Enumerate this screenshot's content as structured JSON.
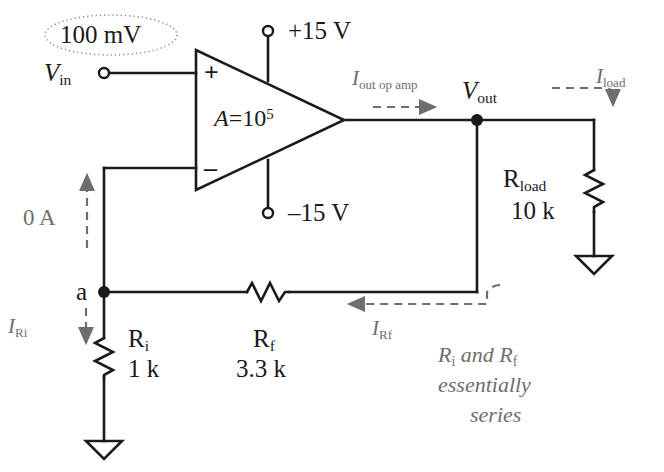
{
  "figure": {
    "type": "circuit-schematic",
    "colors": {
      "wire": "#1a1a1a",
      "annotation": "#6e6e6e",
      "background": "#ffffff"
    }
  },
  "source": {
    "callout_value": "100 mV",
    "input_terminal_label": "V",
    "input_terminal_sub": "in"
  },
  "opamp": {
    "gain_label": "A",
    "gain_equals": "=10",
    "gain_exponent": "5",
    "plus_label": "+",
    "minus_label": "–",
    "supply_pos": "+15 V",
    "supply_neg": "–15 V"
  },
  "output": {
    "node_label": "V",
    "node_sub": "out",
    "current_label": "I",
    "current_sub": "out op amp"
  },
  "load": {
    "name": "R",
    "name_sub": "load",
    "value": "10 k",
    "current_label": "I",
    "current_sub": "load"
  },
  "input_resistor": {
    "name": "R",
    "name_sub": "i",
    "value": "1 k",
    "current_label": "I",
    "current_sub": "Ri"
  },
  "feedback_resistor": {
    "name": "R",
    "name_sub": "f",
    "value": "3.3 k",
    "current_label": "I",
    "current_sub": "Rf"
  },
  "nodes": {
    "summing_node": "a",
    "input_bias_current": "0 A"
  },
  "annotation": {
    "line1_a": "R",
    "line1_a_sub": "i",
    "line1_b": " and R",
    "line1_b_sub": "f",
    "line2": "essentially",
    "line3": "series"
  }
}
